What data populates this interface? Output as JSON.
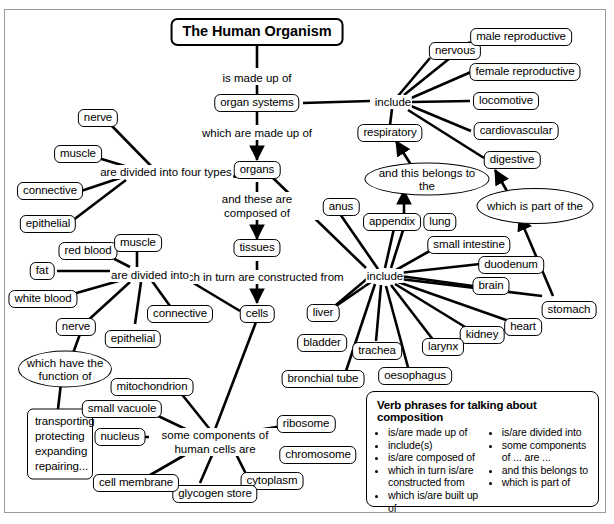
{
  "title": "The Human Organism",
  "linkers": {
    "is_made_up_of": "is made up of",
    "which_are_made_up_of": "which are made up of",
    "and_these_are_composed_of": "and these are composed of",
    "which_in_turn_are_constructed_from": "which in turn are constructed from",
    "are_divided_into_four_types": "are divided into four types",
    "are_divided_into": "are divided into",
    "include_systems": "include",
    "include_organs": "include",
    "some_components_of_human_cells_are": "some components of human cells are"
  },
  "ellipses": {
    "and_this_belongs_to_the": "and this belongs to the",
    "which_is_part_of_the": "which is part of the",
    "which_have_the_function_of": "which have the function of"
  },
  "core": {
    "organ_systems": "organ systems",
    "organs": "organs",
    "tissues": "tissues",
    "cells": "cells"
  },
  "organ_systems": [
    "nervous",
    "male reproductive",
    "female reproductive",
    "locomotive",
    "cardiovascular",
    "digestive",
    "respiratory"
  ],
  "tissue_types": [
    "nerve",
    "muscle",
    "connective",
    "epithelial"
  ],
  "cell_types": [
    "red blood",
    "muscle",
    "fat",
    "white blood",
    "nerve",
    "epithelial",
    "connective"
  ],
  "organs_list": [
    "anus",
    "appendix",
    "lung",
    "small intestine",
    "duodenum",
    "brain",
    "stomach",
    "heart",
    "kidney",
    "larynx",
    "oesophagus",
    "trachea",
    "bronchial tube",
    "bladder",
    "liver"
  ],
  "cell_components": [
    "mitochondrion",
    "small vacuole",
    "nucleus",
    "ribosome",
    "chromosome",
    "cytoplasm",
    "glycogen store",
    "cell membrane"
  ],
  "functions": "transporting protecting expanding repairing...",
  "legend": {
    "title": "Verb phrases for talking about composition",
    "column_left": [
      "is/are made up of",
      "include(s)",
      "is/are composed of",
      "which in turn is/are constructed from",
      "which is/are built up of"
    ],
    "column_right": [
      "is/are divided into",
      "some components of ... are ...",
      "and this belongs to",
      "which is part of"
    ]
  }
}
